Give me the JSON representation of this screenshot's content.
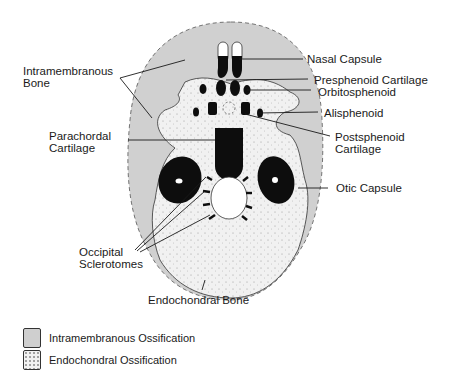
{
  "diagram": {
    "colors": {
      "intramembranous_fill": "#d0d0d0",
      "endochondral_fill": "#f1f1f1",
      "cartilage_black": "#0d0d0d",
      "outline": "#333333"
    },
    "labels": {
      "intramembranous_bone": [
        "Intramembranous",
        "Bone"
      ],
      "parachordal_cartilage": [
        "Parachordal",
        "Cartilage"
      ],
      "occipital_sclerotomes": [
        "Occipital",
        "Sclerotomes"
      ],
      "endochondral_bone": "Endochondral Bone",
      "nasal_capsule": "Nasal Capsule",
      "presphenoid_cartilage": "Presphenoid Cartilage",
      "orbitosphenoid": "Orbitosphenoid",
      "alisphenoid": "Alisphenoid",
      "postsphenoid_cartilage": [
        "Postsphenoid",
        "Cartilage"
      ],
      "otic_capsule": "Otic Capsule"
    }
  },
  "legend": {
    "items": [
      {
        "label": "Intramembranous Ossification",
        "pattern": "solid-gray"
      },
      {
        "label": "Endochondral Ossification",
        "pattern": "stippled"
      }
    ]
  }
}
